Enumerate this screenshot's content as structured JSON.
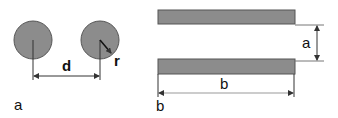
{
  "colors": {
    "shape_fill": "#8c8c8c",
    "shape_stroke": "#555555",
    "line": "#333333",
    "text": "#111111"
  },
  "panel_a": {
    "label": "a",
    "shape": "two parallel circular conductors",
    "distance_label": "d",
    "radius_label": "r"
  },
  "panel_b": {
    "label": "b",
    "shape": "two parallel plates",
    "gap_label": "a",
    "width_label": "b"
  }
}
